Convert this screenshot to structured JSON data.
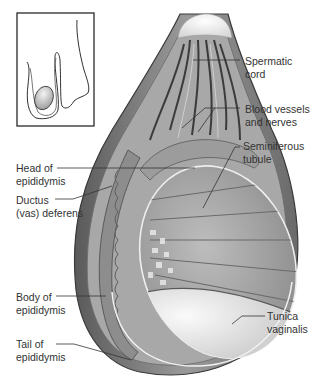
{
  "diagram": {
    "inset": {
      "description": "Small framed inset showing location of testis within scrotum"
    },
    "labels": [
      {
        "id": "spermatic-cord",
        "lines": [
          "Spermatic",
          "cord"
        ]
      },
      {
        "id": "blood-vessels-nerves",
        "lines": [
          "Blood vessels",
          "and nerves"
        ]
      },
      {
        "id": "seminiferous-tubule",
        "lines": [
          "Seminiferous",
          "tubule"
        ]
      },
      {
        "id": "head-of-epididymis",
        "lines": [
          "Head of",
          "epididymis"
        ]
      },
      {
        "id": "ductus-deferens",
        "lines": [
          "Ductus",
          "(vas) deferens"
        ]
      },
      {
        "id": "body-of-epididymis",
        "lines": [
          "Body of",
          "epididymis"
        ]
      },
      {
        "id": "tunica-vaginalis",
        "lines": [
          "Tunica",
          "vaginalis"
        ]
      },
      {
        "id": "tail-of-epididymis",
        "lines": [
          "Tail of",
          "epididymis"
        ]
      }
    ]
  }
}
